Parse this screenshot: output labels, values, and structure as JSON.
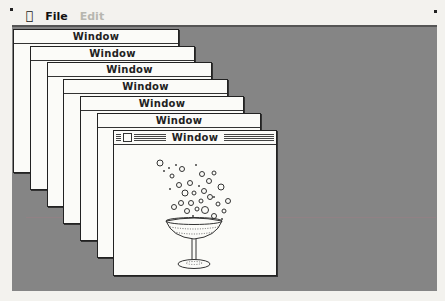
{
  "menubar": {
    "apple_icon": "apple-icon",
    "items": [
      {
        "label": "File",
        "enabled": true
      },
      {
        "label": "Edit",
        "enabled": false
      }
    ]
  },
  "windows": [
    {
      "title": "Window",
      "active": false
    },
    {
      "title": "Window",
      "active": false
    },
    {
      "title": "Window",
      "active": false
    },
    {
      "title": "Window",
      "active": false
    },
    {
      "title": "Window",
      "active": false
    },
    {
      "title": "Window",
      "active": false
    },
    {
      "title": "Window",
      "active": true,
      "content_icon": "champagne-glass-icon"
    }
  ],
  "colors": {
    "desktop": "#858585",
    "window": "#fbfbf8",
    "frame": "#222222"
  }
}
